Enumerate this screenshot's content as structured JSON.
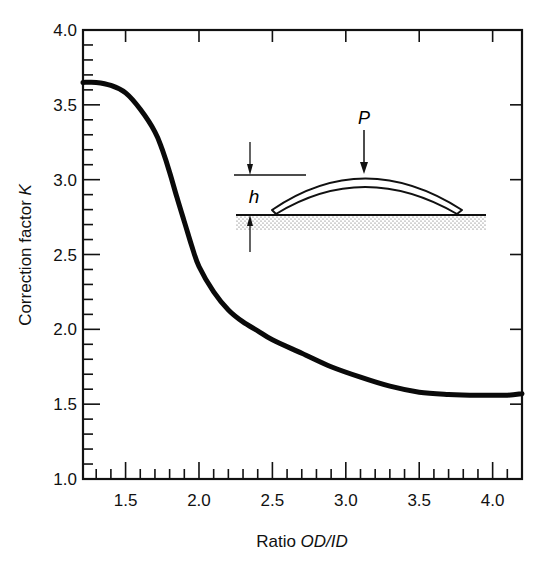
{
  "chart_data": {
    "type": "line",
    "title": "",
    "xlabel": "Ratio OD/ID",
    "xlabel_parts": {
      "plain": "Ratio ",
      "italic": "OD/ID"
    },
    "ylabel": "Correction factor K",
    "ylabel_parts": {
      "plain": "Correction factor ",
      "italic": "K"
    },
    "xlim": [
      1.21,
      4.2
    ],
    "ylim": [
      1.0,
      4.0
    ],
    "x_ticks": [
      "1.5",
      "2.0",
      "2.5",
      "3.0",
      "3.5",
      "4.0"
    ],
    "x_tick_values": [
      1.5,
      2.0,
      2.5,
      3.0,
      3.5,
      4.0
    ],
    "y_ticks": [
      "1.0",
      "1.5",
      "2.0",
      "2.5",
      "3.0",
      "3.5",
      "4.0"
    ],
    "y_tick_values": [
      1.0,
      1.5,
      2.0,
      2.5,
      3.0,
      3.5,
      4.0
    ],
    "grid": false,
    "legend": null,
    "series": [
      {
        "name": "K",
        "x": [
          1.21,
          1.3,
          1.4,
          1.5,
          1.6,
          1.7,
          1.75,
          1.8,
          1.85,
          1.9,
          1.95,
          2.0,
          2.1,
          2.2,
          2.3,
          2.4,
          2.5,
          2.7,
          2.9,
          3.1,
          3.3,
          3.5,
          3.7,
          3.9,
          4.1,
          4.2
        ],
        "values": [
          3.65,
          3.65,
          3.63,
          3.58,
          3.47,
          3.32,
          3.2,
          3.05,
          2.88,
          2.72,
          2.56,
          2.42,
          2.25,
          2.13,
          2.05,
          1.99,
          1.93,
          1.84,
          1.75,
          1.68,
          1.62,
          1.58,
          1.565,
          1.56,
          1.56,
          1.57
        ]
      }
    ],
    "annotations": [
      {
        "type": "inset-diagram",
        "description": "Curved (dished) washer on flat surface with load P, height h",
        "labels": [
          "P",
          "h"
        ]
      }
    ]
  },
  "inset": {
    "load_label": "P",
    "height_label": "h"
  }
}
